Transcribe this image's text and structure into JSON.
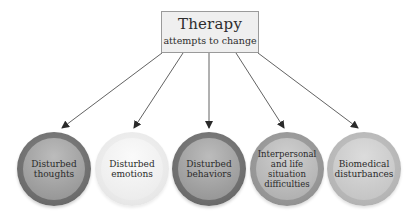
{
  "root": {
    "title": "Therapy",
    "subtitle": "attempts to change"
  },
  "nodes": [
    {
      "label": "Disturbed thoughts",
      "shade": "dark"
    },
    {
      "label": "Disturbed emotions",
      "shade": "light"
    },
    {
      "label": "Disturbed behaviors",
      "shade": "dark"
    },
    {
      "label": "Interpersonal and life situation difficulties",
      "shade": "mid"
    },
    {
      "label": "Biomedical disturbances",
      "shade": "pale"
    }
  ],
  "colors": {
    "box_fill": "#efefef",
    "box_border": "#9a9a9a",
    "arrow": "#3a3a3a",
    "text": "#2b2b2b"
  }
}
